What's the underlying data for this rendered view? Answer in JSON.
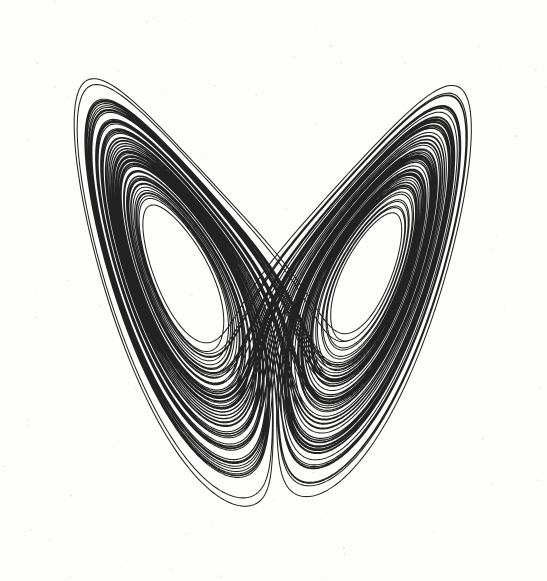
{
  "figure": {
    "kind": "scientific-figure",
    "title": "",
    "caption": "",
    "width_px": 547,
    "height_px": 581,
    "background_color": "#fdfdfc",
    "ink_color": "#111111",
    "has_axes": false,
    "has_axis_labels": false,
    "has_tick_marks": false,
    "has_legend": false,
    "has_border_frame": false,
    "has_text": false,
    "render_style": "scanned-line-drawing"
  },
  "chart_data": {
    "type": "line",
    "title": "",
    "subtitle": "",
    "xlabel": "",
    "ylabel": "",
    "legend": [],
    "legend_position": "none",
    "grid": false,
    "annotations": [],
    "system": "lorenz",
    "equations": [
      "dx/dt = sigma*(y - x)",
      "dy/dt = x*(rho - z) - y",
      "dz/dt = x*y - beta*z"
    ],
    "parameters": {
      "sigma": 10,
      "rho": 28,
      "beta": 2.6666666667
    },
    "initial_conditions": {
      "x": 0.92,
      "y": 0.41,
      "z": 23.6
    },
    "integration": {
      "method": "rk4",
      "dt": 0.0032,
      "steps": 46000,
      "discard_transient_steps": 0
    },
    "projection": {
      "horizontal_variable": "x",
      "vertical_variable": "z",
      "vertical_axis_inverted": true
    },
    "axis_ranges": {
      "x": [
        -22.5,
        22.5
      ],
      "z": [
        0.5,
        49.5
      ]
    },
    "xlim": [
      -22.5,
      22.5
    ],
    "ylim": [
      0.5,
      49.5
    ],
    "plot_box_px": {
      "left": 26,
      "top": 30,
      "right": 523,
      "bottom": 558
    },
    "stroke": {
      "width_px": 1.05,
      "color": "#111111",
      "linejoin": "round",
      "linecap": "round",
      "opacity": 0.93
    },
    "lobe_centers_px": [
      {
        "name": "left-lobe-eye",
        "cx": 182,
        "cy": 283,
        "rx": 48,
        "ry": 68
      },
      {
        "name": "right-lobe-eye",
        "cx": 378,
        "cy": 291,
        "rx": 36,
        "ry": 50
      }
    ],
    "extents_px": {
      "leftmost": 27,
      "rightmost": 521,
      "topmost_left_lobe": 33,
      "topmost_right_lobe": 104,
      "bottommost": 556,
      "crossing_band_x": [
        232,
        342
      ]
    },
    "visual_notes": [
      "Left lobe is larger and reaches higher and further left than the right lobe.",
      "Orbits spiral outward from each lobe eye; outermost orbits are drawn with a single thin line.",
      "Centre band shows a dense criss-cross braid where trajectories swap lobes.",
      "Lower centre shows a near-vertical seam where the two lobes meet around x = 300 px.",
      "Ink is black on slightly off-white paper; faint scan speckle in the margins."
    ]
  }
}
